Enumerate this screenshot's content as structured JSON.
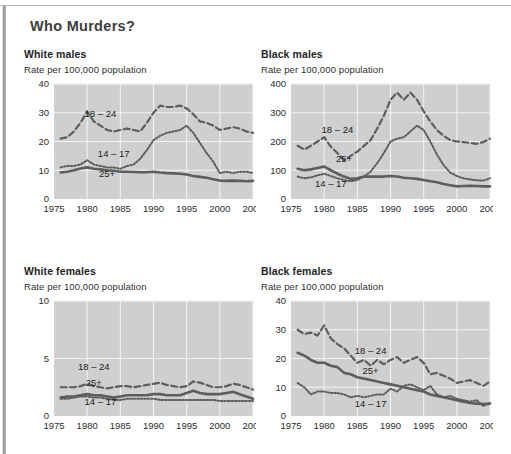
{
  "page": {
    "title": "Who Murders?"
  },
  "axis": {
    "x_ticks": [
      "1975",
      "1980",
      "1985",
      "1990",
      "1995",
      "2000",
      "2005"
    ],
    "x_min": 1975,
    "x_max": 2005,
    "subtitle": "Rate per 100,000 population"
  },
  "series_labels": {
    "young": "18 – 24",
    "teen": "14 – 17",
    "adult": "25+"
  },
  "chart_data": [
    {
      "type": "line",
      "id": "white-males",
      "title": "White males",
      "subtitle": "Rate per 100,000 population",
      "xlabel": "",
      "ylabel": "Rate per 100,000 population",
      "x": [
        1976,
        1977,
        1978,
        1979,
        1980,
        1981,
        1982,
        1983,
        1984,
        1985,
        1986,
        1987,
        1988,
        1989,
        1990,
        1991,
        1992,
        1993,
        1994,
        1995,
        1996,
        1997,
        1998,
        1999,
        2000,
        2001,
        2002,
        2003,
        2004,
        2005
      ],
      "xlim": [
        1975,
        2005
      ],
      "ylim": [
        0,
        40
      ],
      "y_ticks": [
        0,
        10,
        20,
        30,
        40
      ],
      "grid": true,
      "legend": "inline-annotations",
      "series": [
        {
          "name": "18 – 24",
          "style": "dashed",
          "label_x": 1982,
          "label_y": 28.5,
          "values": [
            21,
            21.5,
            23.5,
            26.5,
            30.5,
            27,
            25.5,
            24,
            23.5,
            24,
            24.5,
            24,
            23.5,
            26.5,
            30,
            32.5,
            32,
            32,
            32.5,
            31.5,
            29.5,
            27,
            26.5,
            25.5,
            24,
            24.5,
            25,
            24.5,
            23.5,
            23
          ]
        },
        {
          "name": "14 – 17",
          "style": "dotted",
          "label_x": 1984,
          "label_y": 14.5,
          "values": [
            11,
            11.5,
            11.5,
            12,
            13.5,
            12,
            11.5,
            11,
            11,
            10.5,
            11.5,
            12,
            14,
            17,
            20.5,
            22,
            23,
            23.5,
            24,
            25.5,
            23,
            19.5,
            16,
            13,
            9,
            9.5,
            9,
            9.5,
            9.5,
            9
          ]
        },
        {
          "name": "25+",
          "style": "solid",
          "label_x": 1983,
          "label_y": 7.5,
          "values": [
            9.2,
            9.5,
            10,
            10.6,
            11,
            10.5,
            10.3,
            10,
            9.8,
            9.5,
            9.5,
            9.4,
            9.3,
            9.3,
            9.5,
            9.2,
            9,
            8.9,
            8.8,
            8.5,
            8,
            7.7,
            7.4,
            6.9,
            6.4,
            6.3,
            6.4,
            6.3,
            6.2,
            6.3
          ]
        }
      ]
    },
    {
      "type": "line",
      "id": "black-males",
      "title": "Black males",
      "subtitle": "Rate per 100,000 population",
      "xlabel": "",
      "ylabel": "Rate per 100,000 population",
      "x": [
        1976,
        1977,
        1978,
        1979,
        1980,
        1981,
        1982,
        1983,
        1984,
        1985,
        1986,
        1987,
        1988,
        1989,
        1990,
        1991,
        1992,
        1993,
        1994,
        1995,
        1996,
        1997,
        1998,
        1999,
        2000,
        2001,
        2002,
        2003,
        2004,
        2005
      ],
      "xlim": [
        1975,
        2005
      ],
      "ylim": [
        0,
        400
      ],
      "y_ticks": [
        0,
        100,
        200,
        300,
        400
      ],
      "grid": true,
      "legend": "inline-annotations",
      "series": [
        {
          "name": "18 – 24",
          "style": "dashed",
          "label_x": 1982,
          "label_y": 230,
          "values": [
            185,
            172,
            185,
            200,
            215,
            182,
            160,
            135,
            150,
            165,
            185,
            205,
            245,
            290,
            345,
            370,
            345,
            370,
            345,
            305,
            270,
            240,
            220,
            205,
            200,
            198,
            195,
            192,
            198,
            210
          ]
        },
        {
          "name": "25+",
          "style": "solid",
          "label_x": 1983,
          "label_y": 128,
          "values": [
            105,
            100,
            103,
            108,
            113,
            100,
            88,
            78,
            70,
            72,
            78,
            78,
            78,
            78,
            80,
            78,
            74,
            72,
            70,
            66,
            62,
            58,
            52,
            48,
            44,
            45,
            46,
            45,
            44,
            44
          ]
        },
        {
          "name": "14 – 17",
          "style": "dotted",
          "label_x": 1981,
          "label_y": 42,
          "values": [
            78,
            72,
            75,
            82,
            88,
            80,
            72,
            66,
            62,
            66,
            78,
            95,
            125,
            160,
            200,
            210,
            215,
            235,
            255,
            240,
            200,
            155,
            118,
            92,
            80,
            72,
            68,
            65,
            64,
            72
          ]
        }
      ]
    },
    {
      "type": "line",
      "id": "white-females",
      "title": "White females",
      "subtitle": "Rate per 100,000 population",
      "xlabel": "",
      "ylabel": "Rate per 100,000 population",
      "x": [
        1976,
        1977,
        1978,
        1979,
        1980,
        1981,
        1982,
        1983,
        1984,
        1985,
        1986,
        1987,
        1988,
        1989,
        1990,
        1991,
        1992,
        1993,
        1994,
        1995,
        1996,
        1997,
        1998,
        1999,
        2000,
        2001,
        2002,
        2003,
        2004,
        2005
      ],
      "xlim": [
        1975,
        2005
      ],
      "ylim": [
        0,
        10
      ],
      "y_ticks": [
        0,
        5,
        10
      ],
      "grid": true,
      "legend": "inline-annotations",
      "series": [
        {
          "name": "18 – 24",
          "style": "dashed",
          "label_x": 1981,
          "label_y": 4.0,
          "values": [
            2.5,
            2.5,
            2.5,
            2.6,
            2.8,
            2.6,
            2.5,
            2.4,
            2.5,
            2.6,
            2.6,
            2.5,
            2.6,
            2.7,
            2.8,
            2.9,
            2.7,
            2.6,
            2.5,
            2.6,
            3.0,
            2.9,
            2.7,
            2.5,
            2.5,
            2.6,
            2.8,
            2.7,
            2.5,
            2.3
          ]
        },
        {
          "name": "25+",
          "style": "solid",
          "label_x": 1981,
          "label_y": 2.6,
          "values": [
            1.6,
            1.7,
            1.7,
            1.8,
            1.9,
            1.8,
            1.8,
            1.7,
            1.6,
            1.7,
            1.8,
            1.8,
            1.8,
            1.8,
            1.9,
            1.9,
            1.8,
            1.8,
            1.8,
            2.0,
            2.2,
            2.0,
            1.9,
            1.9,
            1.9,
            2.0,
            2.1,
            1.9,
            1.7,
            1.5
          ]
        },
        {
          "name": "14 – 17",
          "style": "dotted",
          "label_x": 1982,
          "label_y": 1.0,
          "values": [
            1.5,
            1.5,
            1.6,
            1.7,
            1.7,
            1.6,
            1.6,
            1.5,
            1.4,
            1.4,
            1.5,
            1.5,
            1.5,
            1.5,
            1.5,
            1.4,
            1.4,
            1.4,
            1.4,
            1.4,
            1.4,
            1.4,
            1.4,
            1.4,
            1.3,
            1.3,
            1.3,
            1.3,
            1.3,
            1.3
          ]
        }
      ]
    },
    {
      "type": "line",
      "id": "black-females",
      "title": "Black females",
      "subtitle": "Rate per 100,000 population",
      "xlabel": "",
      "ylabel": "Rate per 100,000 population",
      "x": [
        1976,
        1977,
        1978,
        1979,
        1980,
        1981,
        1982,
        1983,
        1984,
        1985,
        1986,
        1987,
        1988,
        1989,
        1990,
        1991,
        1992,
        1993,
        1994,
        1995,
        1996,
        1997,
        1998,
        1999,
        2000,
        2001,
        2002,
        2003,
        2004,
        2005
      ],
      "xlim": [
        1975,
        2005
      ],
      "ylim": [
        0,
        40
      ],
      "y_ticks": [
        0,
        10,
        20,
        30,
        40
      ],
      "grid": true,
      "legend": "inline-annotations",
      "series": [
        {
          "name": "18 – 24",
          "style": "dashed",
          "label_x": 1987,
          "label_y": 21.5,
          "values": [
            30,
            28.5,
            29,
            28,
            31.5,
            27,
            25,
            23.5,
            21,
            18.5,
            19.5,
            17.5,
            19.5,
            18,
            19.5,
            20.5,
            18.5,
            19.5,
            20.5,
            18.5,
            14.5,
            15,
            14,
            13,
            11.5,
            12,
            12.5,
            11.5,
            10.5,
            12
          ]
        },
        {
          "name": "25+",
          "style": "solid",
          "label_x": 1987,
          "label_y": 14.5,
          "values": [
            22,
            21,
            19.5,
            18.5,
            18.5,
            17.5,
            17,
            15,
            14.5,
            13.5,
            13,
            12.5,
            12,
            11.5,
            11,
            10.5,
            10,
            9.5,
            9,
            8.5,
            7.5,
            7,
            6.5,
            6,
            5.5,
            5,
            4.5,
            4.3,
            4.2,
            4.3
          ]
        },
        {
          "name": "14 – 17",
          "style": "dotted",
          "label_x": 1987,
          "label_y": 3.0,
          "values": [
            11.5,
            10,
            7.5,
            8.5,
            8.5,
            8,
            8,
            7.5,
            6.5,
            7,
            6.5,
            7,
            7.5,
            7.5,
            9.5,
            8.5,
            10.5,
            11,
            10,
            9,
            10.5,
            7.5,
            6.5,
            7,
            6,
            5.5,
            5,
            5.5,
            3.5,
            4.5
          ]
        }
      ]
    }
  ]
}
